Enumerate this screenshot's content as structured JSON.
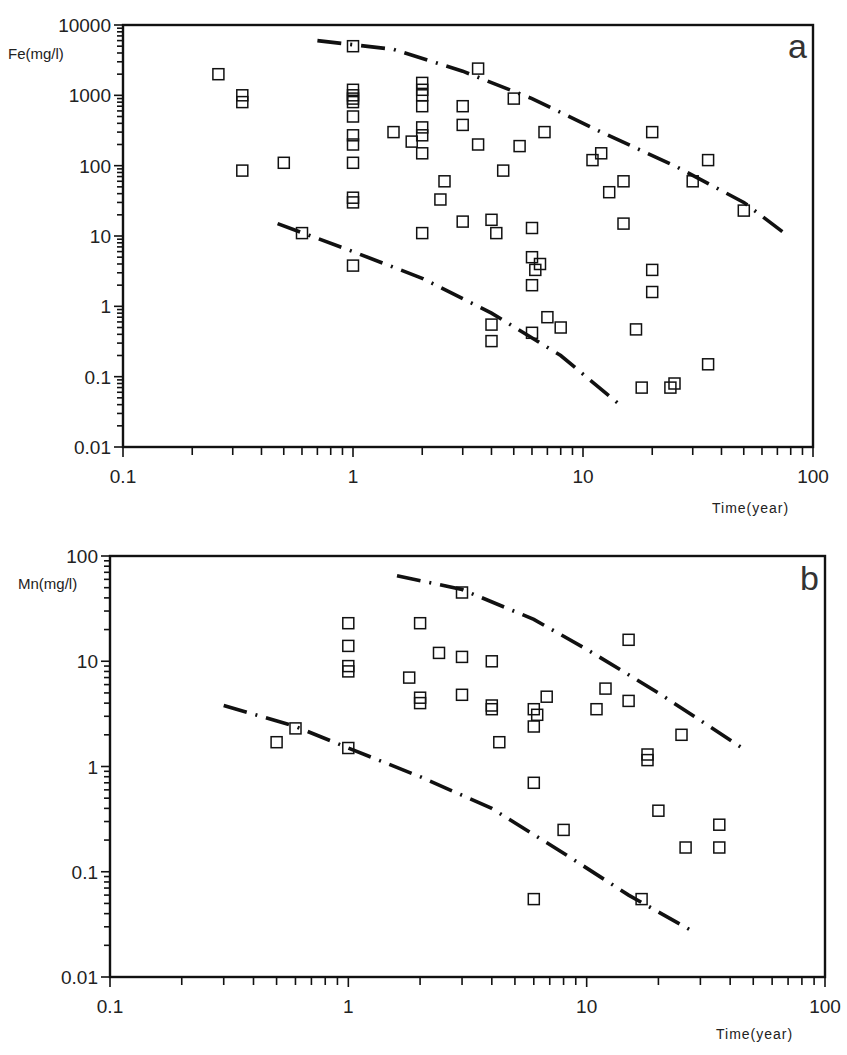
{
  "chart_data": [
    {
      "type": "scatter",
      "panel_label": "a",
      "title": "",
      "xlabel": "Time(year)",
      "ylabel": "Fe(mg/l)",
      "xscale": "log",
      "yscale": "log",
      "xlim": [
        0.1,
        100
      ],
      "ylim": [
        0.01,
        10000
      ],
      "x_ticks": [
        "0.1",
        "1",
        "10",
        "100"
      ],
      "y_ticks": [
        "0.01",
        "0.1",
        "1",
        "10",
        "100",
        "1000",
        "10000"
      ],
      "grid": false,
      "legend": null,
      "series": [
        {
          "name": "observations",
          "marker": "open-square",
          "points": [
            [
              0.26,
              2000
            ],
            [
              0.33,
              1000
            ],
            [
              0.33,
              800
            ],
            [
              0.33,
              85
            ],
            [
              0.5,
              110
            ],
            [
              0.6,
              11
            ],
            [
              1.0,
              5000
            ],
            [
              1.0,
              1200
            ],
            [
              1.0,
              1000
            ],
            [
              1.0,
              900
            ],
            [
              1.0,
              800
            ],
            [
              1.0,
              500
            ],
            [
              1.0,
              270
            ],
            [
              1.0,
              200
            ],
            [
              1.0,
              110
            ],
            [
              1.0,
              35
            ],
            [
              1.0,
              30
            ],
            [
              1.0,
              3.8
            ],
            [
              1.5,
              300
            ],
            [
              1.8,
              220
            ],
            [
              2.0,
              1500
            ],
            [
              2.0,
              1200
            ],
            [
              2.0,
              1000
            ],
            [
              2.0,
              700
            ],
            [
              2.0,
              350
            ],
            [
              2.0,
              270
            ],
            [
              2.0,
              150
            ],
            [
              2.0,
              11
            ],
            [
              2.4,
              33
            ],
            [
              2.5,
              60
            ],
            [
              3.0,
              700
            ],
            [
              3.0,
              380
            ],
            [
              3.0,
              16
            ],
            [
              3.5,
              2400
            ],
            [
              3.5,
              200
            ],
            [
              4.0,
              17
            ],
            [
              4.0,
              0.55
            ],
            [
              4.0,
              0.32
            ],
            [
              4.2,
              11
            ],
            [
              4.5,
              85
            ],
            [
              5.0,
              900
            ],
            [
              5.3,
              190
            ],
            [
              6.0,
              13
            ],
            [
              6.0,
              5
            ],
            [
              6.0,
              2
            ],
            [
              6.0,
              0.42
            ],
            [
              6.2,
              3.3
            ],
            [
              6.5,
              4
            ],
            [
              6.8,
              300
            ],
            [
              7.0,
              0.7
            ],
            [
              8.0,
              0.5
            ],
            [
              11,
              120
            ],
            [
              12,
              150
            ],
            [
              13,
              42
            ],
            [
              15,
              15
            ],
            [
              15,
              60
            ],
            [
              17,
              0.47
            ],
            [
              18,
              0.07
            ],
            [
              20,
              300
            ],
            [
              20,
              3.3
            ],
            [
              20,
              1.6
            ],
            [
              24,
              0.07
            ],
            [
              25,
              0.08
            ],
            [
              30,
              60
            ],
            [
              35,
              120
            ],
            [
              35,
              0.15
            ],
            [
              50,
              23
            ]
          ]
        }
      ],
      "curves": [
        {
          "name": "upper-envelope",
          "style": "dash-dot",
          "points": [
            [
              0.7,
              6000
            ],
            [
              1.5,
              4500
            ],
            [
              3,
              2200
            ],
            [
              6,
              900
            ],
            [
              12,
              300
            ],
            [
              25,
              100
            ],
            [
              50,
              30
            ],
            [
              75,
              11
            ]
          ]
        },
        {
          "name": "lower-envelope",
          "style": "dash-dot",
          "points": [
            [
              0.47,
              15
            ],
            [
              1,
              6
            ],
            [
              2,
              2.5
            ],
            [
              4,
              0.8
            ],
            [
              8,
              0.2
            ],
            [
              15,
              0.036
            ]
          ]
        }
      ]
    },
    {
      "type": "scatter",
      "panel_label": "b",
      "title": "",
      "xlabel": "Time(year)",
      "ylabel": "Mn(mg/l)",
      "xscale": "log",
      "yscale": "log",
      "xlim": [
        0.1,
        100
      ],
      "ylim": [
        0.01,
        100
      ],
      "x_ticks": [
        "0.1",
        "1",
        "10",
        "100"
      ],
      "y_ticks": [
        "0.01",
        "0.1",
        "1",
        "10",
        "100"
      ],
      "grid": false,
      "legend": null,
      "series": [
        {
          "name": "observations",
          "marker": "open-square",
          "points": [
            [
              0.5,
              1.7
            ],
            [
              0.6,
              2.3
            ],
            [
              1.0,
              23
            ],
            [
              1.0,
              14
            ],
            [
              1.0,
              9
            ],
            [
              1.0,
              8
            ],
            [
              1.0,
              1.5
            ],
            [
              1.8,
              7
            ],
            [
              2.0,
              23
            ],
            [
              2.0,
              4.5
            ],
            [
              2.0,
              4
            ],
            [
              2.4,
              12
            ],
            [
              3.0,
              45
            ],
            [
              3.0,
              11
            ],
            [
              3.0,
              4.8
            ],
            [
              4.0,
              10
            ],
            [
              4.0,
              3.8
            ],
            [
              4.0,
              3.5
            ],
            [
              4.3,
              1.7
            ],
            [
              6.0,
              3.5
            ],
            [
              6.0,
              2.4
            ],
            [
              6.0,
              0.7
            ],
            [
              6.0,
              0.055
            ],
            [
              6.2,
              3.1
            ],
            [
              6.8,
              4.6
            ],
            [
              8.0,
              0.25
            ],
            [
              11,
              3.5
            ],
            [
              12,
              5.5
            ],
            [
              15,
              16
            ],
            [
              15,
              4.2
            ],
            [
              17,
              0.055
            ],
            [
              18,
              1.3
            ],
            [
              18,
              1.15
            ],
            [
              20,
              0.38
            ],
            [
              25,
              2
            ],
            [
              26,
              0.17
            ],
            [
              36,
              0.28
            ],
            [
              36,
              0.17
            ]
          ]
        }
      ],
      "curves": [
        {
          "name": "upper-envelope",
          "style": "dash-dot",
          "points": [
            [
              1.6,
              65
            ],
            [
              3,
              48
            ],
            [
              6,
              25
            ],
            [
              10,
              13
            ],
            [
              20,
              5
            ],
            [
              45,
              1.5
            ]
          ]
        },
        {
          "name": "lower-envelope",
          "style": "dash-dot",
          "points": [
            [
              0.3,
              3.8
            ],
            [
              0.6,
              2.4
            ],
            [
              1,
              1.5
            ],
            [
              2,
              0.8
            ],
            [
              4,
              0.4
            ],
            [
              8,
              0.15
            ],
            [
              15,
              0.06
            ],
            [
              28,
              0.027
            ]
          ]
        }
      ]
    }
  ],
  "panels": {
    "a": {
      "label": "a",
      "ylabel": "Fe(mg/l)",
      "xlabel": "Time(year)"
    },
    "b": {
      "label": "b",
      "ylabel": "Mn(mg/l)",
      "xlabel": "Time(year)"
    }
  }
}
